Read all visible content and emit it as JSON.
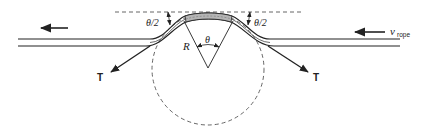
{
  "diagram": {
    "type": "rope-over-pulley free-body diagram",
    "labels": {
      "half_angle_left": "θ/2",
      "half_angle_right": "θ/2",
      "radius": "R",
      "angle": "θ",
      "tension_left": "T",
      "tension_right": "T",
      "velocity_main": "v",
      "velocity_sub": "rope"
    },
    "colors": {
      "line": "#222222",
      "dashed": "#555555",
      "shaded_segment": "#b5b5b5"
    },
    "icons": {
      "motion_arrow_left": "arrow-left-icon",
      "velocity_arrow": "arrow-left-icon"
    }
  }
}
